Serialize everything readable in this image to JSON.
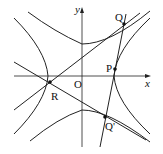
{
  "diagram": {
    "type": "hyperbola-tangent-figure",
    "axes": {
      "x_label": "x",
      "y_label": "y",
      "origin_label": "O"
    },
    "points": [
      {
        "id": "R",
        "label": "R"
      },
      {
        "id": "P",
        "label": "P"
      },
      {
        "id": "Q",
        "label": "Q"
      },
      {
        "id": "Qp",
        "label": "Q'"
      }
    ],
    "curves": [
      "conjugate hyperbola (upper/lower branches)",
      "hyperbola (left/right branches)"
    ],
    "lines": [
      "tangent R–Q",
      "tangent R–Q'",
      "line Q–Q' through P"
    ],
    "colors": {
      "stroke": "#222222",
      "background": "#ffffff"
    }
  }
}
